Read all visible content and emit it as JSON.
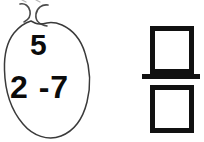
{
  "canvas": {
    "width": 204,
    "height": 142,
    "background_color": "#ffffff",
    "ink_color": "#111111",
    "outline_color": "#3a3a3a"
  },
  "balloon": {
    "shape_name": "hand-drawn-oval-balloon",
    "stroke_color": "#3a3a3a",
    "numbers": {
      "top": "5",
      "bottom": "2 -7"
    },
    "tokens": [
      "5",
      "2",
      "-7"
    ]
  },
  "fraction": {
    "numerator_value": "",
    "denominator_value": "",
    "bar_color": "#111111",
    "box_border_color": "#111111",
    "box_fill_color": "#ffffff"
  }
}
